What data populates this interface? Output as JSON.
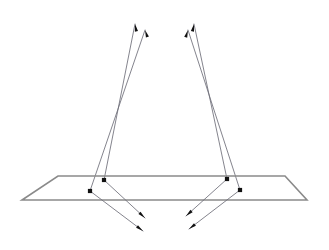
{
  "figure": {
    "background_color": "#ffffff",
    "width": 329,
    "height": 250
  },
  "style": {
    "plane_edge_color": "#8a8a8a",
    "plane_fill_color": "#ffffff",
    "ray_color": "#6e6e78",
    "node_color": "#111111",
    "arrow_color": "#111111",
    "plane_edge_width": 1.6,
    "ray_width": 0.85,
    "node_size": 4.2,
    "arrow_length": 7.5,
    "arrow_width": 3.2
  },
  "plane": {
    "name": "ground-plane",
    "shape": "parallelogram",
    "points": "58,176 285,176 307,200 22,200",
    "corners": [
      {
        "label": "top-left",
        "x": 58,
        "y": 176
      },
      {
        "label": "top-right",
        "x": 285,
        "y": 176
      },
      {
        "label": "bottom-right",
        "x": 307,
        "y": 200
      },
      {
        "label": "bottom-left",
        "x": 22,
        "y": 200
      }
    ]
  },
  "nodes": [
    {
      "id": "node-left-far",
      "x": 104,
      "y": 180,
      "cluster": "left"
    },
    {
      "id": "node-left-near",
      "x": 90,
      "y": 191,
      "cluster": "left"
    },
    {
      "id": "node-right-far",
      "x": 227,
      "y": 179,
      "cluster": "right"
    },
    {
      "id": "node-right-near",
      "x": 240,
      "y": 190,
      "cluster": "right"
    }
  ],
  "rays_up": [
    {
      "id": "ray-up-left-a",
      "x1": 104,
      "y1": 180,
      "x2": 135,
      "y2": 24,
      "cluster": "left"
    },
    {
      "id": "ray-up-left-b",
      "x1": 90,
      "y1": 191,
      "x2": 145,
      "y2": 30,
      "cluster": "left"
    },
    {
      "id": "ray-up-right-a",
      "x1": 227,
      "y1": 179,
      "x2": 194,
      "y2": 24,
      "cluster": "right"
    },
    {
      "id": "ray-up-right-b",
      "x1": 240,
      "y1": 190,
      "x2": 188,
      "y2": 30,
      "cluster": "right"
    }
  ],
  "rays_down": [
    {
      "id": "ray-down-left-a",
      "x1": 104,
      "y1": 180,
      "x2": 145,
      "y2": 218,
      "cluster": "left"
    },
    {
      "id": "ray-down-left-b",
      "x1": 90,
      "y1": 191,
      "x2": 143,
      "y2": 231,
      "cluster": "left"
    },
    {
      "id": "ray-down-right-a",
      "x1": 227,
      "y1": 179,
      "x2": 186,
      "y2": 216,
      "cluster": "right"
    },
    {
      "id": "ray-down-right-b",
      "x1": 240,
      "y1": 190,
      "x2": 189,
      "y2": 229,
      "cluster": "right"
    }
  ],
  "arrow_tips_up": [
    {
      "id": "tip-up-left-a",
      "x": 135,
      "y": 24,
      "angle_deg": 258.8
    },
    {
      "id": "tip-up-left-b",
      "x": 145,
      "y": 30,
      "angle_deg": 251.1
    },
    {
      "id": "tip-up-right-a",
      "x": 194,
      "y": 24,
      "angle_deg": 281.9
    },
    {
      "id": "tip-up-right-b",
      "x": 188,
      "y": 30,
      "angle_deg": 287.9
    }
  ],
  "arrow_tips_down": [
    {
      "id": "tip-down-left-a",
      "x": 145,
      "y": 218,
      "angle_deg": 42.8
    },
    {
      "id": "tip-down-left-b",
      "x": 143,
      "y": 231,
      "angle_deg": 37.0
    },
    {
      "id": "tip-down-right-a",
      "x": 186,
      "y": 216,
      "angle_deg": 137.9
    },
    {
      "id": "tip-down-right-b",
      "x": 189,
      "y": 229,
      "angle_deg": 142.6
    }
  ]
}
